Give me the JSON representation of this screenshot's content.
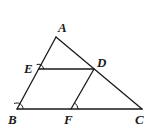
{
  "diagram": {
    "points": {
      "A": {
        "label": "A",
        "x": 56,
        "y": 37,
        "label_x": 58,
        "label_y": 32
      },
      "E": {
        "label": "E",
        "x": 39,
        "y": 69,
        "label_x": 24,
        "label_y": 73
      },
      "D": {
        "label": "D",
        "x": 94,
        "y": 69,
        "label_x": 97,
        "label_y": 67
      },
      "B": {
        "label": "B",
        "x": 17,
        "y": 109,
        "label_x": 8,
        "label_y": 124
      },
      "F": {
        "label": "F",
        "x": 71,
        "y": 109,
        "label_x": 64,
        "label_y": 124
      },
      "C": {
        "label": "C",
        "x": 142,
        "y": 109,
        "label_x": 135,
        "label_y": 124
      }
    },
    "segments": [
      "AB",
      "AC",
      "BC",
      "ED",
      "DF"
    ],
    "angle_marks": [
      "E",
      "B",
      "F"
    ],
    "stroke_color": "#1a1a1a",
    "background": "#ffffff"
  }
}
